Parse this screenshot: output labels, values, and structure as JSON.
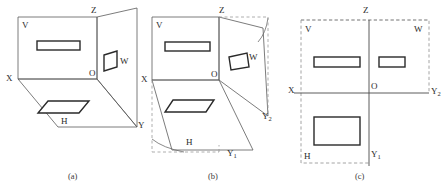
{
  "figure": {
    "panels": [
      {
        "id": "a",
        "caption": "(a)",
        "description": "Three mutually perpendicular projection planes V, H, W in pictorial (folded) position",
        "labels": {
          "v_plane": "V",
          "h_plane": "H",
          "w_plane": "W",
          "origin": "O",
          "axis_x": "X",
          "axis_y": "Y",
          "axis_z": "Z"
        }
      },
      {
        "id": "b",
        "caption": "(b)",
        "description": "H plane and W plane rotating about the X and Z axes, unfolding into the V plane; rotation arcs shown",
        "labels": {
          "v_plane": "V",
          "h_plane": "H",
          "w_plane": "W",
          "origin": "O",
          "axis_x": "X",
          "axis_y1": "Y",
          "axis_y1_sub": "1",
          "axis_y2": "Y",
          "axis_y2_sub": "2",
          "axis_z": "Z"
        }
      },
      {
        "id": "c",
        "caption": "(c)",
        "description": "All three planes unfolded into one plane giving the front view, top view and left side view",
        "labels": {
          "v_plane": "V",
          "h_plane": "H",
          "w_plane": "W",
          "origin": "O",
          "axis_x": "X",
          "axis_y1": "Y",
          "axis_y1_sub": "1",
          "axis_y2": "Y",
          "axis_y2_sub": "2",
          "axis_z": "Z"
        }
      }
    ],
    "colors": {
      "background": "#ffffff",
      "line": "#555555",
      "shape_stroke": "#2a2a2a",
      "dashed": "#8a8a8a",
      "text": "#2b2b2b"
    }
  }
}
